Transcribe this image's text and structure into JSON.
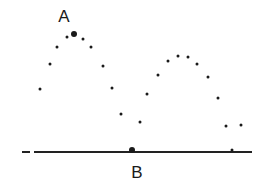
{
  "labels": {
    "a": {
      "text": "A",
      "x": 64,
      "y": 16
    },
    "b": {
      "text": "B",
      "x": 137,
      "y": 172
    }
  },
  "baseline": {
    "x1": 34,
    "x2": 252,
    "y": 152,
    "dash": {
      "x1": 22,
      "x2": 30
    }
  },
  "points": [
    {
      "x": 40,
      "y": 89,
      "r": 3
    },
    {
      "x": 50,
      "y": 64,
      "r": 3
    },
    {
      "x": 57,
      "y": 47,
      "r": 3
    },
    {
      "x": 67,
      "y": 37,
      "r": 3
    },
    {
      "x": 74,
      "y": 34,
      "r": 6,
      "marker": "A"
    },
    {
      "x": 83,
      "y": 39,
      "r": 3
    },
    {
      "x": 91,
      "y": 47,
      "r": 3
    },
    {
      "x": 103,
      "y": 66,
      "r": 3
    },
    {
      "x": 112,
      "y": 88,
      "r": 3
    },
    {
      "x": 121,
      "y": 114,
      "r": 3
    },
    {
      "x": 140,
      "y": 122,
      "r": 3
    },
    {
      "x": 132,
      "y": 150,
      "r": 6,
      "marker": "B"
    },
    {
      "x": 147,
      "y": 94,
      "r": 3
    },
    {
      "x": 158,
      "y": 75,
      "r": 3
    },
    {
      "x": 168,
      "y": 61,
      "r": 3
    },
    {
      "x": 178,
      "y": 56,
      "r": 3
    },
    {
      "x": 188,
      "y": 57,
      "r": 3
    },
    {
      "x": 197,
      "y": 64,
      "r": 3
    },
    {
      "x": 208,
      "y": 77,
      "r": 3
    },
    {
      "x": 218,
      "y": 98,
      "r": 3
    },
    {
      "x": 226,
      "y": 126,
      "r": 3
    },
    {
      "x": 241,
      "y": 125,
      "r": 3
    },
    {
      "x": 232,
      "y": 150,
      "r": 3
    }
  ],
  "colors": {
    "ink": "#1a1a1a",
    "background": "#ffffff"
  }
}
